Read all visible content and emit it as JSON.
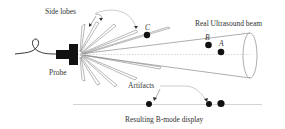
{
  "diagram": {
    "labels": {
      "side_lobes": "Side lobes",
      "real_beam": "Real Ultrasound beam",
      "probe": "Probe",
      "artifacts": "Artifacts",
      "display": "Resulting B-mode display"
    },
    "points": {
      "a": "A",
      "b": "B",
      "c": "C"
    },
    "colors": {
      "line": "#8a8a8a",
      "probe": "#111111",
      "dot": "#111111",
      "text": "#333333"
    }
  }
}
